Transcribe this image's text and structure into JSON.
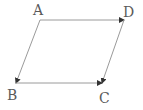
{
  "diagram": {
    "type": "vector-parallelogram",
    "colors": {
      "line": "#9a9a9a",
      "arrow": "#333333",
      "label": "#5a5a5a",
      "background": "#ffffff"
    },
    "points": {
      "A": {
        "label": "A",
        "x": 40,
        "y": 20
      },
      "B": {
        "label": "B",
        "x": 16,
        "y": 83
      },
      "C": {
        "label": "C",
        "x": 102,
        "y": 83
      },
      "D": {
        "label": "D",
        "x": 124,
        "y": 20
      }
    },
    "vectors": [
      {
        "from": "A",
        "to": "D"
      },
      {
        "from": "A",
        "to": "B"
      },
      {
        "from": "B",
        "to": "C"
      },
      {
        "from": "D",
        "to": "C"
      }
    ]
  }
}
